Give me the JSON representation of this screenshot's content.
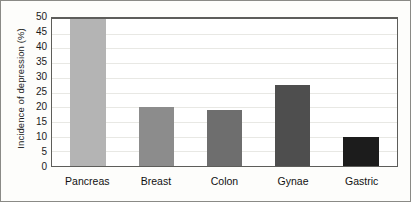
{
  "chart_data": {
    "type": "bar",
    "title": "",
    "subtitle": "",
    "xlabel": "",
    "ylabel": "Incidence of depression (%)",
    "categories": [
      "Pancreas",
      "Breast",
      "Colon",
      "Gynae",
      "Gastric"
    ],
    "values": [
      50,
      20,
      19,
      27.5,
      9.8
    ],
    "series": [
      {
        "name": "Incidence of depression",
        "values": [
          50,
          20,
          19,
          27.5,
          9.8
        ]
      }
    ],
    "bar_colors": [
      "#b4b4b4",
      "#8c8c8c",
      "#6e6e6e",
      "#4e4e4e",
      "#1c1c1c"
    ],
    "ylim": [
      0,
      50
    ],
    "ytick_values": [
      0,
      5,
      10,
      15,
      20,
      25,
      30,
      35,
      40,
      45,
      50
    ],
    "ytick_labels": [
      "0",
      "5",
      "10",
      "15",
      "20",
      "25",
      "30",
      "35",
      "40",
      "45",
      "50"
    ],
    "grid": true,
    "grid_axis": "y",
    "legend": false,
    "legend_position": "none",
    "data_labels": false,
    "frame_color": "#8a8a86",
    "axis_color": "#5d5d5a",
    "gridline_color": "#e8e8e4",
    "background_color": "#ffffff"
  }
}
